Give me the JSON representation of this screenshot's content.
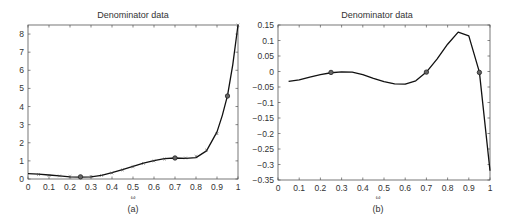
{
  "chart_data": [
    {
      "panel": "(a)",
      "type": "line",
      "title": "Denominator data",
      "xlabel": "ω",
      "ylabel": "",
      "xlim": [
        0,
        1
      ],
      "ylim": [
        0,
        8.5
      ],
      "xticks": [
        0,
        0.1,
        0.2,
        0.3,
        0.4,
        0.5,
        0.6,
        0.7,
        0.8,
        0.9,
        1
      ],
      "xtick_labels": [
        "0",
        "0.1",
        "0.2",
        "0.3",
        "0.4",
        "0.5",
        "0.6",
        "0.7",
        "0.8",
        "0.9",
        "1"
      ],
      "yticks": [
        0,
        1,
        2,
        3,
        4,
        5,
        6,
        7,
        8
      ],
      "ytick_labels": [
        "0",
        "1",
        "2",
        "3",
        "4",
        "5",
        "6",
        "7",
        "8"
      ],
      "grid": false,
      "series": [
        {
          "name": "fitted curve",
          "style": "solid line",
          "x": [
            0,
            0.05,
            0.1,
            0.15,
            0.2,
            0.25,
            0.3,
            0.35,
            0.4,
            0.45,
            0.5,
            0.55,
            0.6,
            0.65,
            0.7,
            0.75,
            0.8,
            0.85,
            0.9,
            0.925,
            0.95,
            0.975,
            1.0
          ],
          "y": [
            0.3,
            0.27,
            0.22,
            0.17,
            0.12,
            0.1,
            0.12,
            0.2,
            0.35,
            0.52,
            0.7,
            0.88,
            1.02,
            1.12,
            1.16,
            1.14,
            1.18,
            1.55,
            2.6,
            3.5,
            4.6,
            6.3,
            8.5
          ]
        },
        {
          "name": "data samples",
          "style": "small x markers",
          "x": [
            0.05,
            0.1,
            0.15,
            0.2,
            0.3,
            0.35,
            0.4,
            0.45,
            0.5,
            0.55,
            0.6,
            0.65,
            0.75,
            0.8,
            0.85,
            0.9,
            1.0
          ],
          "y": [
            0.25,
            0.2,
            0.17,
            0.14,
            0.15,
            0.2,
            0.33,
            0.5,
            0.68,
            0.86,
            1.0,
            1.1,
            1.16,
            1.25,
            1.6,
            2.5,
            8.5
          ]
        },
        {
          "name": "interpolation points",
          "style": "circle markers",
          "x": [
            0.25,
            0.7,
            0.95
          ],
          "y": [
            0.12,
            1.16,
            4.58
          ]
        }
      ],
      "caption": "(a)"
    },
    {
      "panel": "(b)",
      "type": "line",
      "title": "Denominator data",
      "xlabel": "ω",
      "ylabel": "",
      "xlim": [
        0,
        1
      ],
      "ylim": [
        -0.35,
        0.15
      ],
      "xticks": [
        0,
        0.1,
        0.2,
        0.3,
        0.4,
        0.5,
        0.6,
        0.7,
        0.8,
        0.9,
        1
      ],
      "xtick_labels": [
        "0",
        "0.1",
        "0.2",
        "0.3",
        "0.4",
        "0.5",
        "0.6",
        "0.7",
        "0.8",
        "0.9",
        "1"
      ],
      "yticks": [
        0.15,
        0.1,
        0.05,
        0,
        -0.05,
        -0.1,
        -0.15,
        -0.2,
        -0.25,
        -0.3,
        -0.35
      ],
      "ytick_labels": [
        "0.15",
        "0.1",
        "0.05",
        "0",
        "−0.05",
        "−0.1",
        "−0.15",
        "−0.2",
        "−0.25",
        "−0.3",
        "−0.35"
      ],
      "grid": false,
      "series": [
        {
          "name": "fitted curve",
          "style": "solid line",
          "x": [
            0.05,
            0.1,
            0.15,
            0.2,
            0.25,
            0.3,
            0.35,
            0.4,
            0.45,
            0.5,
            0.55,
            0.6,
            0.65,
            0.7,
            0.75,
            0.8,
            0.85,
            0.9,
            0.95,
            1.0
          ],
          "y": [
            -0.032,
            -0.027,
            -0.018,
            -0.01,
            -0.004,
            -0.001,
            -0.002,
            -0.01,
            -0.022,
            -0.033,
            -0.04,
            -0.041,
            -0.03,
            -0.002,
            0.04,
            0.088,
            0.127,
            0.115,
            -0.002,
            -0.32
          ]
        },
        {
          "name": "interpolation points",
          "style": "circle markers",
          "x": [
            0.25,
            0.7,
            0.95
          ],
          "y": [
            -0.003,
            -0.002,
            -0.003
          ]
        }
      ],
      "caption": "(b)"
    }
  ]
}
